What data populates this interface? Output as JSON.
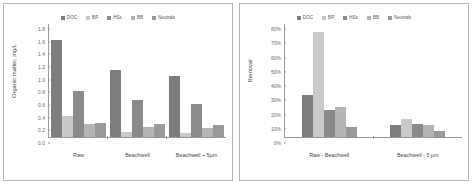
{
  "figure": {
    "series_colors": [
      "#7d7d7d",
      "#c9c9c9",
      "#8a8a8a",
      "#b4b4b4",
      "#999999"
    ],
    "panels": [
      "left",
      "right"
    ]
  },
  "chart_data": [
    {
      "type": "bar",
      "panel": "left",
      "title": "",
      "xlabel": "",
      "ylabel": "Organic matter, mg/L",
      "categories": [
        "Raw",
        "Beachwell",
        "Beachwell + 5µm"
      ],
      "series": [
        {
          "name": "DOC",
          "values": [
            1.55,
            1.06,
            0.97
          ]
        },
        {
          "name": "BP",
          "values": [
            0.34,
            0.08,
            0.07
          ]
        },
        {
          "name": "HSs",
          "values": [
            0.73,
            0.59,
            0.53
          ]
        },
        {
          "name": "BB",
          "values": [
            0.21,
            0.16,
            0.14
          ]
        },
        {
          "name": "Neutrals",
          "values": [
            0.22,
            0.2,
            0.19
          ]
        }
      ],
      "ylim": [
        0.0,
        1.8
      ],
      "yticks": [
        "1.8",
        "1.6",
        "1.4",
        "1.2",
        "1.0",
        "0.8",
        "0.6",
        "0.4",
        "0.2",
        "0.0"
      ],
      "ytick_values": [
        1.8,
        1.6,
        1.4,
        1.2,
        1.0,
        0.8,
        0.6,
        0.4,
        0.2,
        0.0
      ],
      "grid": false,
      "legend_position": "top"
    },
    {
      "type": "bar",
      "panel": "right",
      "title": "",
      "xlabel": "",
      "ylabel": "Removal",
      "categories": [
        "Raw - Beachwell",
        "Beachwell - 5 µm"
      ],
      "series": [
        {
          "name": "DOC",
          "values": [
            30,
            8.5
          ]
        },
        {
          "name": "BP",
          "values": [
            74,
            13
          ]
        },
        {
          "name": "HSs",
          "values": [
            19,
            9
          ]
        },
        {
          "name": "BB",
          "values": [
            21,
            8.5
          ]
        },
        {
          "name": "Neutrals",
          "values": [
            7,
            4
          ]
        }
      ],
      "ylim": [
        0,
        80
      ],
      "yticks": [
        "80%",
        "70%",
        "60%",
        "50%",
        "40%",
        "30%",
        "20%",
        "10%",
        "0%"
      ],
      "ytick_values": [
        80,
        70,
        60,
        50,
        40,
        30,
        20,
        10,
        0
      ],
      "grid": false,
      "legend_position": "top"
    }
  ]
}
